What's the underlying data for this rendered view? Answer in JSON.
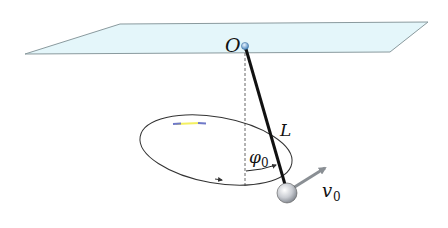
{
  "labels": {
    "pivot": "O",
    "length": "L",
    "angle": "φ",
    "angle_sub": "0",
    "velocity": "v",
    "velocity_sub": "0"
  },
  "colors": {
    "plane_fill": "#e4f6fa",
    "plane_stroke": "#8a9a9e",
    "rod": "#111111",
    "orbit": "#333333",
    "arrow": "#8a8f94",
    "pivot": "#6aa6d6"
  }
}
